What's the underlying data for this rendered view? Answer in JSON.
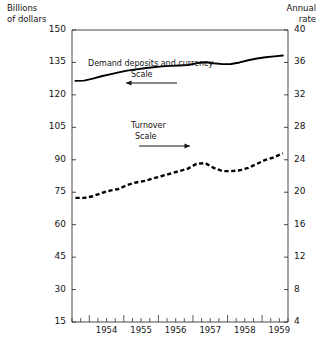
{
  "header": {
    "left_title_line1": "Billions",
    "left_title_line2": "of dollars",
    "right_title_line1": "Annual",
    "right_title_line2": "rate"
  },
  "axes": {
    "left_ticks": [
      "150",
      "135",
      "120",
      "105",
      "90",
      "75",
      "60",
      "45",
      "30",
      "15"
    ],
    "right_ticks": [
      "40",
      "36",
      "32",
      "28",
      "24",
      "20",
      "16",
      "12",
      "8",
      "4"
    ],
    "x_ticks": [
      "1954",
      "1955",
      "1956",
      "1957",
      "1958",
      "1959"
    ]
  },
  "annotations": {
    "series1_name": "Demand deposits and currency",
    "series1_scale_word": "Scale",
    "series1_arrow": "left-arrow-icon",
    "series2_name": "Turnover",
    "series2_scale_word": "Scale",
    "series2_arrow": "right-arrow-icon"
  },
  "chart_data": {
    "type": "line",
    "title": "",
    "subtitle": "",
    "xlabel": "",
    "ylabel": "Billions of dollars",
    "y2label": "Annual rate",
    "grid": false,
    "legend": "inline-annotation",
    "xlim": [
      1953.5,
      1959.75
    ],
    "ylim": [
      15,
      150
    ],
    "y2lim": [
      4,
      40
    ],
    "x_tick_values": [
      1954,
      1955,
      1956,
      1957,
      1958,
      1959
    ],
    "minor_x_ticks_per_year": 4,
    "series": [
      {
        "name": "Demand deposits and currency",
        "axis": "left",
        "style": "solid",
        "color": "#000000",
        "x": [
          1953.6,
          1953.85,
          1954.1,
          1954.35,
          1954.6,
          1954.85,
          1955.1,
          1955.35,
          1955.6,
          1955.85,
          1956.1,
          1956.35,
          1956.6,
          1956.85,
          1957.1,
          1957.35,
          1957.6,
          1957.85,
          1958.1,
          1958.35,
          1958.6,
          1958.85,
          1959.1,
          1959.35,
          1959.6
        ],
        "values": [
          126.5,
          126.6,
          127.5,
          128.6,
          129.5,
          130.4,
          131.2,
          131.8,
          132.3,
          132.8,
          133.2,
          133.4,
          133.6,
          133.8,
          134.6,
          135.1,
          134.6,
          134.2,
          134.3,
          135.0,
          136.0,
          136.8,
          137.4,
          137.8,
          138.2
        ]
      },
      {
        "name": "Turnover",
        "axis": "right",
        "style": "dashed",
        "color": "#000000",
        "x": [
          1953.6,
          1953.85,
          1954.1,
          1954.35,
          1954.6,
          1954.85,
          1955.1,
          1955.35,
          1955.6,
          1955.85,
          1956.1,
          1956.35,
          1956.6,
          1956.85,
          1957.1,
          1957.35,
          1957.6,
          1957.85,
          1958.1,
          1958.35,
          1958.6,
          1958.85,
          1959.1,
          1959.35,
          1959.6
        ],
        "values": [
          19.3,
          19.3,
          19.5,
          19.9,
          20.2,
          20.4,
          20.9,
          21.2,
          21.4,
          21.7,
          22.0,
          22.3,
          22.6,
          22.9,
          23.5,
          23.6,
          23.0,
          22.6,
          22.6,
          22.7,
          23.0,
          23.5,
          24.0,
          24.3,
          24.8
        ]
      }
    ],
    "plot_box_px": {
      "left": 72,
      "right": 288,
      "top": 30,
      "bottom": 322
    }
  }
}
